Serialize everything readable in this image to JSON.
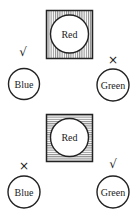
{
  "panels": [
    {
      "square": {
        "label": "Red",
        "hatch": "vertical"
      },
      "left": {
        "label": "Blue",
        "mark": "√",
        "mark_name": "check-icon"
      },
      "right": {
        "label": "Green",
        "mark": "×",
        "mark_name": "cross-icon"
      }
    },
    {
      "square": {
        "label": "Red",
        "hatch": "horizontal"
      },
      "left": {
        "label": "Blue",
        "mark": "×",
        "mark_name": "cross-icon"
      },
      "right": {
        "label": "Green",
        "mark": "√",
        "mark_name": "check-icon"
      }
    }
  ],
  "colors": {
    "ink": "#222222",
    "background": "#ffffff"
  }
}
